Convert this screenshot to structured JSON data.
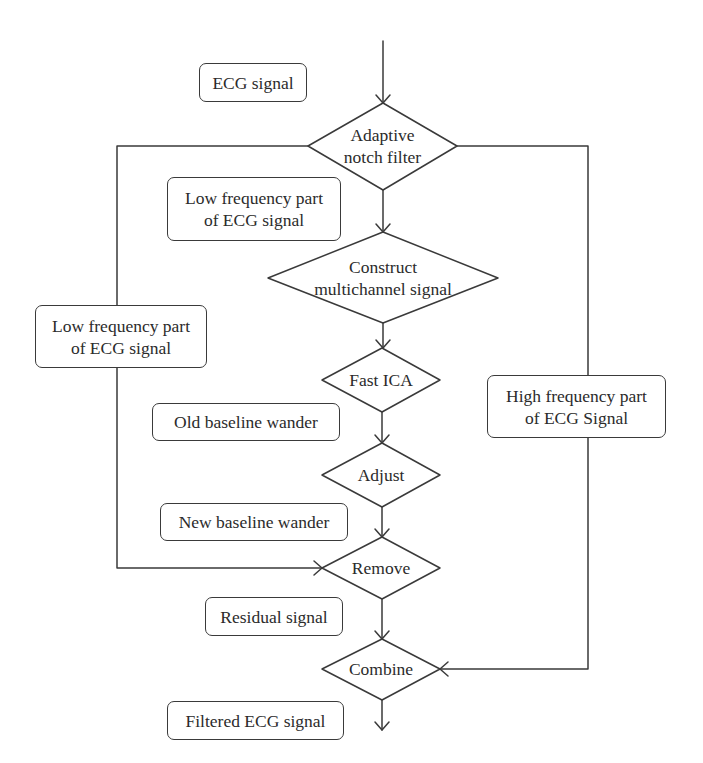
{
  "diagram": {
    "title": "",
    "colors": {
      "stroke": "#3a3a3a",
      "text": "#2b2b2b",
      "background": "#ffffff"
    },
    "nodes": [
      {
        "id": "adaptive-notch-filter",
        "shape": "diamond",
        "lines": [
          "Adaptive",
          "notch filter"
        ]
      },
      {
        "id": "construct-multichannel",
        "shape": "diamond",
        "lines": [
          "Construct",
          "multichannel signal"
        ]
      },
      {
        "id": "fast-ica",
        "shape": "diamond",
        "lines": [
          "Fast ICA"
        ]
      },
      {
        "id": "adjust",
        "shape": "diamond",
        "lines": [
          "Adjust"
        ]
      },
      {
        "id": "remove",
        "shape": "diamond",
        "lines": [
          "Remove"
        ]
      },
      {
        "id": "combine",
        "shape": "diamond",
        "lines": [
          "Combine"
        ]
      }
    ],
    "labels": {
      "ecg_signal": "ECG signal",
      "low_freq_center": [
        "Low frequency part",
        "of ECG signal"
      ],
      "low_freq_left": [
        "Low frequency part",
        "of ECG signal"
      ],
      "high_freq_right": [
        "High frequency part",
        "of ECG Signal"
      ],
      "old_baseline": "Old baseline wander",
      "new_baseline": "New baseline wander",
      "residual": "Residual signal",
      "filtered": "Filtered ECG signal"
    },
    "edges": [
      {
        "from": "input",
        "to": "adaptive-notch-filter",
        "label": "ECG signal"
      },
      {
        "from": "adaptive-notch-filter",
        "to": "construct-multichannel",
        "label": "Low frequency part of ECG signal"
      },
      {
        "from": "construct-multichannel",
        "to": "fast-ica"
      },
      {
        "from": "fast-ica",
        "to": "adjust",
        "label": "Old baseline wander"
      },
      {
        "from": "adjust",
        "to": "remove",
        "label": "New baseline wander"
      },
      {
        "from": "adaptive-notch-filter",
        "to": "remove",
        "label": "Low frequency part of ECG signal",
        "route": "left"
      },
      {
        "from": "remove",
        "to": "combine",
        "label": "Residual signal"
      },
      {
        "from": "adaptive-notch-filter",
        "to": "combine",
        "label": "High frequency part of ECG Signal",
        "route": "right"
      },
      {
        "from": "combine",
        "to": "output",
        "label": "Filtered ECG signal"
      }
    ]
  }
}
